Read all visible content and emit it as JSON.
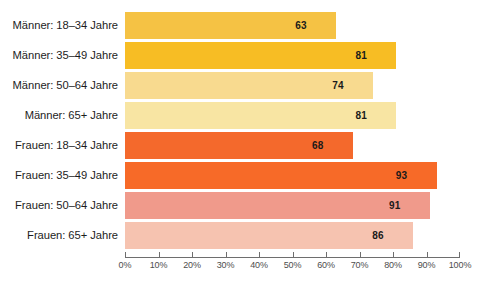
{
  "chart_data": {
    "type": "bar",
    "orientation": "horizontal",
    "title": "",
    "xlabel": "",
    "ylabel": "",
    "xlim": [
      0,
      100
    ],
    "grid": false,
    "legend": "none",
    "value_suffix": "%",
    "categories": [
      "Männer: 18–34 Jahre",
      "Männer: 35–49 Jahre",
      "Männer: 50–64 Jahre",
      "Männer: 65+ Jahre",
      "Frauen: 18–34 Jahre",
      "Frauen: 35–49 Jahre",
      "Frauen: 50–64 Jahre",
      "Frauen: 65+ Jahre"
    ],
    "values": [
      63,
      81,
      74,
      81,
      68,
      93,
      91,
      86
    ],
    "colors": [
      "#f5c244",
      "#f7bd24",
      "#f8da8f",
      "#f8e5a3",
      "#f4692c",
      "#f76a28",
      "#f09a8b",
      "#f6c3b0"
    ],
    "bars": [
      {
        "label": "Männer: 18–34 Jahre",
        "value": 63,
        "value_text": "63",
        "color": "#f5c244"
      },
      {
        "label": "Männer: 35–49 Jahre",
        "value": 81,
        "value_text": "81",
        "color": "#f7bd24"
      },
      {
        "label": "Männer: 50–64 Jahre",
        "value": 74,
        "value_text": "74",
        "color": "#f8da8f"
      },
      {
        "label": "Männer: 65+ Jahre",
        "value": 81,
        "value_text": "81",
        "color": "#f8e5a3"
      },
      {
        "label": "Frauen: 18–34 Jahre",
        "value": 68,
        "value_text": "68",
        "color": "#f4692c"
      },
      {
        "label": "Frauen: 35–49 Jahre",
        "value": 93,
        "value_text": "93",
        "color": "#f76a28"
      },
      {
        "label": "Frauen: 50–64 Jahre",
        "value": 91,
        "value_text": "91",
        "color": "#f09a8b"
      },
      {
        "label": "Frauen: 65+ Jahre",
        "value": 86,
        "value_text": "86",
        "color": "#f6c3b0"
      }
    ],
    "xticks": [
      0,
      10,
      20,
      30,
      40,
      50,
      60,
      70,
      80,
      90,
      100
    ],
    "xticklabels": [
      "0%",
      "10%",
      "20%",
      "30%",
      "40%",
      "50%",
      "60%",
      "70%",
      "80%",
      "90%",
      "100%"
    ]
  },
  "axis": {
    "line_color": "#6e6e6e"
  }
}
